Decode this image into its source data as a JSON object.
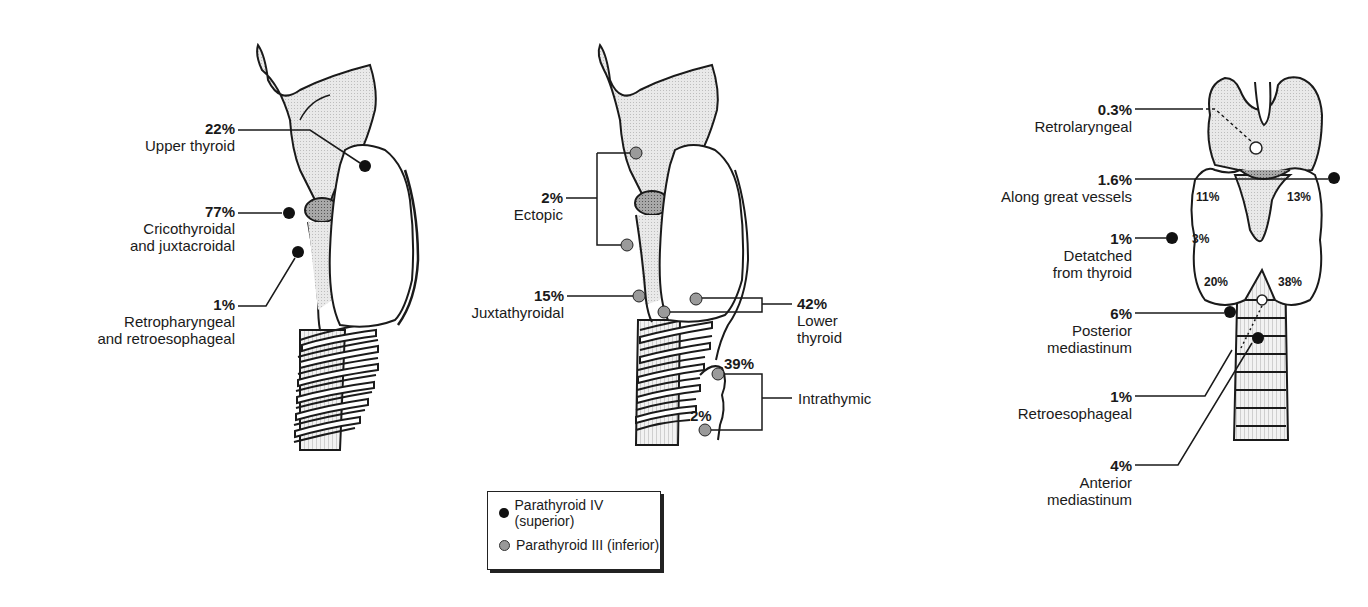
{
  "figure": {
    "colors": {
      "superior": "#111111",
      "inferior": "#9a9a9a",
      "cartilage": "#e6e6e6",
      "cricoid": "#b0b0b0"
    }
  },
  "panels": [
    {
      "name": "lateral-superior",
      "labels": [
        {
          "pct": "22%",
          "text": [
            "Upper thyroid"
          ]
        },
        {
          "pct": "77%",
          "text": [
            "Cricothyroidal",
            "and juxtacroidal"
          ]
        },
        {
          "pct": "1%",
          "text": [
            "Retropharyngeal",
            "and retroesophageal"
          ]
        }
      ]
    },
    {
      "name": "lateral-inferior",
      "labels": [
        {
          "pct": "2%",
          "text": [
            "Ectopic"
          ]
        },
        {
          "pct": "15%",
          "text": [
            "Juxtathyroidal"
          ]
        },
        {
          "pct": "42%",
          "text": [
            "Lower",
            "thyroid"
          ]
        },
        {
          "pct": "39%",
          "text": []
        },
        {
          "pct": "2%",
          "text": []
        },
        {
          "pct": "",
          "text": [
            "Intrathymic"
          ]
        }
      ]
    },
    {
      "name": "posterior-view",
      "labels": [
        {
          "pct": "0.3%",
          "text": [
            "Retrolaryngeal"
          ]
        },
        {
          "pct": "1.6%",
          "text": [
            "Along great vessels"
          ]
        },
        {
          "pct": "1%",
          "text": [
            "Detatched",
            "from thyroid"
          ]
        },
        {
          "pct": "6%",
          "text": [
            "Posterior",
            "mediastinum"
          ]
        },
        {
          "pct": "1%",
          "text": [
            "Retroesophageal"
          ]
        },
        {
          "pct": "4%",
          "text": [
            "Anterior",
            "mediastinum"
          ]
        }
      ],
      "inner_labels": [
        "11%",
        "13%",
        "3%",
        "20%",
        "38%"
      ]
    }
  ],
  "legend": {
    "items": [
      {
        "label": "Parathyroid IV (superior)",
        "marker": "black-dot"
      },
      {
        "label": "Parathyroid III (inferior)",
        "marker": "grey-dot"
      }
    ]
  }
}
